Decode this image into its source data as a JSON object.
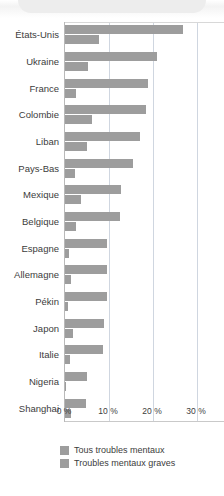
{
  "chart_data": {
    "type": "bar",
    "orientation": "horizontal",
    "title": "",
    "subtitle": "",
    "xlabel": "",
    "ylabel": "",
    "xlim": [
      0,
      30
    ],
    "xunit": "%",
    "grid": true,
    "legend_position": "bottom-left",
    "xticks": [
      {
        "value": 0,
        "label": "0 %"
      },
      {
        "value": 10,
        "label": "10 %"
      },
      {
        "value": 20,
        "label": "20 %"
      },
      {
        "value": 30,
        "label": "30 %"
      }
    ],
    "categories": [
      "États-Unis",
      "Ukraine",
      "France",
      "Colombie",
      "Liban",
      "Pays-Bas",
      "Mexique",
      "Belgique",
      "Espagne",
      "Allemagne",
      "Pékin",
      "Japon",
      "Italie",
      "Nigeria",
      "Shanghai"
    ],
    "series": [
      {
        "name": "Tous troubles mentaux",
        "color": "#9d9d9d",
        "values": [
          26.8,
          21.0,
          18.9,
          18.5,
          17.0,
          15.5,
          12.8,
          12.6,
          9.6,
          9.6,
          9.6,
          8.9,
          8.6,
          5.0,
          4.8
        ]
      },
      {
        "name": "Troubles mentaux graves",
        "color": "#9d9d9d",
        "values": [
          7.8,
          5.2,
          2.5,
          6.1,
          5.0,
          2.3,
          3.7,
          2.4,
          1.0,
          1.3,
          0.6,
          1.8,
          1.2,
          0.3,
          1.3
        ]
      }
    ]
  },
  "legend": {
    "items": [
      {
        "label": "Tous troubles mentaux"
      },
      {
        "label": "Troubles mentaux graves"
      }
    ]
  }
}
